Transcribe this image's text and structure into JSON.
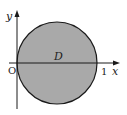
{
  "diagram": {
    "region_label": "D",
    "x_axis_label": "x",
    "y_axis_label": "y",
    "origin_label": "O",
    "x_tick_label": "1",
    "colors": {
      "region_fill": "#a9a9a9",
      "outline": "#1a1a1a",
      "axis": "#1a1a1a",
      "background": "#ffffff"
    },
    "shape": {
      "type": "circle",
      "center": [
        0.5,
        0
      ],
      "radius": 0.5,
      "description": "Shaded disk D bounded by a circle passing through the origin and (1, 0)"
    }
  }
}
